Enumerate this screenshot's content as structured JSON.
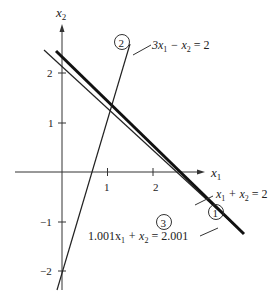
{
  "diagram": {
    "type": "linear-equations-graph",
    "axes": {
      "x_label": "x",
      "x_sub": "1",
      "y_label": "x",
      "y_sub": "2",
      "x_ticks": [
        "1",
        "2"
      ],
      "y_ticks": [
        "2",
        "1",
        "−1",
        "−2"
      ]
    },
    "lines": [
      {
        "id": "1",
        "marker": "1",
        "equation_parts": [
          "x",
          "1",
          " + x",
          "2",
          " = 2"
        ],
        "style": "thin"
      },
      {
        "id": "2",
        "marker": "2",
        "equation_parts": [
          "3x",
          "1",
          " − x",
          "2",
          " = 2"
        ],
        "style": "thin"
      },
      {
        "id": "3",
        "marker": "3",
        "equation_parts": [
          "1.001x",
          "1",
          " + x",
          "2",
          " = 2.001"
        ],
        "style": "thick"
      }
    ]
  }
}
